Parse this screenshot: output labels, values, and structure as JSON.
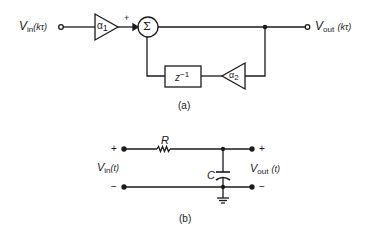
{
  "diagram_a": {
    "caption": "(a)",
    "input_label": {
      "main": "V",
      "sub": "in",
      "arg": "(kτ)"
    },
    "output_label": {
      "main": "V",
      "sub": "out",
      "arg": "(kτ)"
    },
    "gain1": {
      "main": "α",
      "sub": "1"
    },
    "gain2": {
      "main": "α",
      "sub": "2"
    },
    "sum_symbol": "Σ",
    "sum_sign": "+",
    "delay": {
      "main": "z",
      "sup": "−1"
    }
  },
  "diagram_b": {
    "caption": "(b)",
    "resistor_label": "R",
    "capacitor_label": "C",
    "input_label": {
      "main": "V",
      "sub": "in",
      "arg": "(t)"
    },
    "output_label": {
      "main": "V",
      "sub": "out",
      "arg": "(t)"
    },
    "in_plus": "+",
    "in_minus": "−",
    "out_plus": "+",
    "out_minus": "−"
  },
  "colors": {
    "ink": "#1a1a1a",
    "background": "#ffffff"
  }
}
